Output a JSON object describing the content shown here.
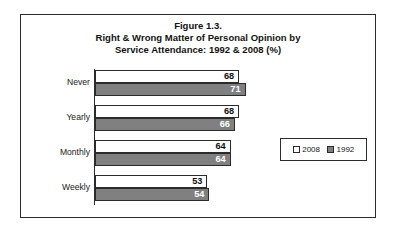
{
  "figure": {
    "title_lines": [
      "Figure 1.3.",
      "Right & Wrong Matter of Personal Opinion by",
      "Service Attendance: 1992 & 2008 (%)"
    ]
  },
  "legend": {
    "entries": [
      {
        "label": "2008",
        "swatch": "white-square-icon",
        "color": "#ffffff"
      },
      {
        "label": "1992",
        "swatch": "gray-square-icon",
        "color": "#808080"
      }
    ]
  },
  "chart_data": {
    "type": "bar",
    "orientation": "horizontal",
    "title": "Figure 1.3. Right & Wrong Matter of Personal Opinion by Service Attendance: 1992 & 2008 (%)",
    "xlabel": "",
    "ylabel": "",
    "categories": [
      "Never",
      "Yearly",
      "Monthly",
      "Weekly"
    ],
    "series": [
      {
        "name": "2008",
        "color": "#ffffff",
        "values": [
          68,
          68,
          64,
          53
        ]
      },
      {
        "name": "1992",
        "color": "#808080",
        "values": [
          71,
          66,
          64,
          54
        ]
      }
    ],
    "xlim": [
      0,
      80
    ],
    "grid": false,
    "legend_position": "middle-right",
    "value_labels": true,
    "axis_tick_labels": []
  }
}
